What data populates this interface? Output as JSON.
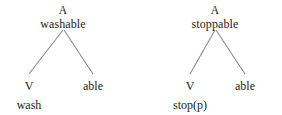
{
  "figure": {
    "background_color": "#ffffff",
    "text_color": "#1a1a1a",
    "branch_color": "#8a8a8a",
    "trees": [
      {
        "id": "washable",
        "root": {
          "category": "A",
          "form": "washable"
        },
        "children": [
          {
            "category": "V",
            "form": "wash"
          },
          {
            "category": "able",
            "form": ""
          }
        ]
      },
      {
        "id": "stoppable",
        "root": {
          "category": "A",
          "form": "stoppable"
        },
        "children": [
          {
            "category": "V",
            "form": "stop(p)"
          },
          {
            "category": "able",
            "form": ""
          }
        ]
      }
    ]
  }
}
